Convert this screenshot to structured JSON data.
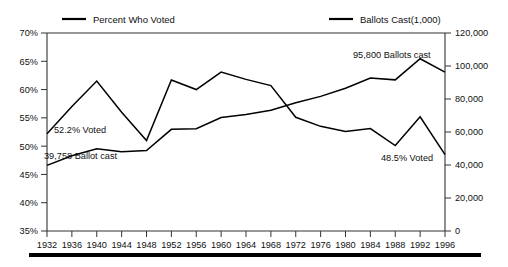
{
  "chart_data": {
    "type": "line",
    "title": "",
    "xlabel": "",
    "grid": false,
    "legend_position": "top",
    "categories": [
      1932,
      1936,
      1940,
      1944,
      1948,
      1952,
      1956,
      1960,
      1964,
      1968,
      1972,
      1976,
      1980,
      1984,
      1988,
      1992,
      1996
    ],
    "x": [
      "1932",
      "1936",
      "1940",
      "1944",
      "1948",
      "1952",
      "1956",
      "1960",
      "1964",
      "1968",
      "1972",
      "1976",
      "1980",
      "1984",
      "1988",
      "1992",
      "1996"
    ],
    "axes": {
      "left": {
        "label": "Percent Who Voted",
        "ylim": [
          35,
          70
        ],
        "ticks": [
          35,
          40,
          45,
          50,
          55,
          60,
          65,
          70
        ],
        "ticklabels": [
          "35%",
          "40%",
          "45%",
          "50%",
          "55%",
          "60%",
          "65%",
          "70%"
        ]
      },
      "right": {
        "label": "Ballots Cast(1,000)",
        "ylim": [
          0,
          120000
        ],
        "ticks": [
          0,
          20000,
          40000,
          60000,
          80000,
          100000,
          120000
        ],
        "ticklabels": [
          "0",
          "20,000",
          "40,000",
          "60,000",
          "80,000",
          "100,000",
          "120,000"
        ]
      }
    },
    "series": [
      {
        "name": "Percent Who Voted",
        "axis": "left",
        "unit": "percent",
        "values": [
          52.2,
          57.0,
          61.5,
          56.0,
          51.0,
          61.7,
          60.0,
          63.1,
          61.8,
          60.7,
          55.1,
          53.5,
          52.6,
          53.1,
          50.1,
          55.2,
          48.5
        ]
      },
      {
        "name": "Ballots Cast(1,000)",
        "axis": "right",
        "unit": "thousands",
        "values": [
          39758,
          45600,
          49900,
          48000,
          48800,
          61600,
          62000,
          68800,
          70600,
          73200,
          77700,
          81600,
          86500,
          92700,
          91600,
          104400,
          96300
        ]
      }
    ],
    "annotations": [
      {
        "name": "start-percent",
        "text": "52.2% Voted",
        "x": 1932,
        "value": 52.2,
        "axis": "left"
      },
      {
        "name": "start-ballots",
        "text": "39,758 Ballot cast",
        "x": 1932,
        "value": 39758,
        "axis": "right"
      },
      {
        "name": "peak-ballots",
        "text": "95,800 Ballots cast",
        "x": 1992,
        "value": 95800,
        "axis": "right"
      },
      {
        "name": "end-percent",
        "text": "48.5% Voted",
        "x": 1996,
        "value": 48.5,
        "axis": "left"
      }
    ]
  },
  "legend": {
    "items": [
      {
        "label": "Percent Who Voted"
      },
      {
        "label": "Ballots Cast(1,000)"
      }
    ]
  },
  "colors": {
    "series_line": "#000000",
    "axis": "#333333",
    "text": "#111111",
    "rule": "#000000"
  }
}
